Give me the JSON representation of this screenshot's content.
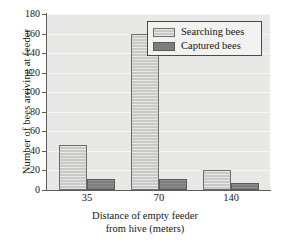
{
  "chart_data": {
    "type": "bar",
    "title": "",
    "xlabel": "Distance of empty feeder from hive (meters)",
    "xlabel_line1": "Distance of empty feeder",
    "xlabel_line2": "from hive (meters)",
    "ylabel": "Number of bees arriving at feeder",
    "categories": [
      "35",
      "70",
      "140"
    ],
    "series": [
      {
        "name": "Searching bees",
        "values": [
          46,
          160,
          20
        ],
        "color": "#c9c9c7"
      },
      {
        "name": "Captured bees",
        "values": [
          11,
          11,
          7
        ],
        "color": "#7d7d7d"
      }
    ],
    "ylim": [
      0,
      180
    ],
    "yticks": [
      0,
      20,
      40,
      60,
      80,
      100,
      120,
      140,
      160,
      180
    ],
    "ytick_labels": [
      "0",
      "20",
      "40",
      "60",
      "80",
      "100",
      "120",
      "140",
      "160",
      "180"
    ],
    "grid": true,
    "grid_axis": "y",
    "legend_position": "top right",
    "legend_entries": [
      "Searching bees",
      "Captured bees"
    ],
    "plot_background": "#e8e8e6",
    "axis_color": "#5d5d5d"
  }
}
